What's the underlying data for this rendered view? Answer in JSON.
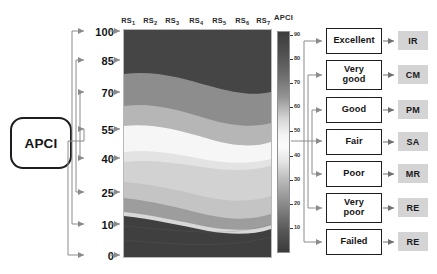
{
  "source": {
    "label": "APCI"
  },
  "axis": {
    "name": "APCI score axis",
    "ticks": [
      "100",
      "85",
      "70",
      "55",
      "40",
      "25",
      "10",
      "0"
    ]
  },
  "plot": {
    "column_headers": [
      {
        "base": "RS",
        "sub": "1"
      },
      {
        "base": "RS",
        "sub": "2"
      },
      {
        "base": "RS",
        "sub": "3"
      },
      {
        "base": "RS",
        "sub": "4"
      },
      {
        "base": "RS",
        "sub": "5"
      },
      {
        "base": "RS",
        "sub": "6"
      },
      {
        "base": "RS",
        "sub": "7"
      }
    ]
  },
  "colorbar": {
    "title": "APCI",
    "ticks": [
      "90",
      "80",
      "70",
      "60",
      "50",
      "40",
      "30",
      "20",
      "10"
    ]
  },
  "ratings": [
    {
      "label": "Excellent",
      "action": "IR"
    },
    {
      "label": "Very\ngood",
      "action": "CM"
    },
    {
      "label": "Good",
      "action": "PM"
    },
    {
      "label": "Fair",
      "action": "SA"
    },
    {
      "label": "Poor",
      "action": "MR"
    },
    {
      "label": "Very\npoor",
      "action": "RE"
    },
    {
      "label": "Failed",
      "action": "RE"
    }
  ],
  "chart_data": {
    "type": "heatmap",
    "title": "APCI",
    "xlabel": "",
    "ylabel": "APCI",
    "grid": false,
    "legend_position": "right-colorbar",
    "x": [
      "RS1",
      "RS2",
      "RS3",
      "RS4",
      "RS5",
      "RS6",
      "RS7"
    ],
    "ylim": [
      0,
      100
    ],
    "yticks": [
      0,
      10,
      25,
      40,
      55,
      70,
      85,
      100
    ],
    "colorbar_range": [
      10,
      90
    ],
    "colorbar_ticks": [
      10,
      20,
      30,
      40,
      50,
      60,
      70,
      80,
      90
    ],
    "bands": [
      {
        "name": "Failed",
        "apci_range": [
          0,
          10
        ],
        "color": "#3f3f3f"
      },
      {
        "name": "Very poor",
        "apci_range": [
          10,
          25
        ],
        "color": "#6a6a6a"
      },
      {
        "name": "Poor",
        "apci_range": [
          25,
          40
        ],
        "color": "#9a9a9a"
      },
      {
        "name": "Fair",
        "apci_range": [
          40,
          55
        ],
        "color": "#c9c9c9"
      },
      {
        "name": "Good",
        "apci_range": [
          55,
          70
        ],
        "color": "#efefef"
      },
      {
        "name": "Very good",
        "apci_range": [
          70,
          85
        ],
        "color": "#8f8f8f"
      },
      {
        "name": "Excellent",
        "apci_range": [
          85,
          100
        ],
        "color": "#4a4a4a"
      }
    ]
  }
}
